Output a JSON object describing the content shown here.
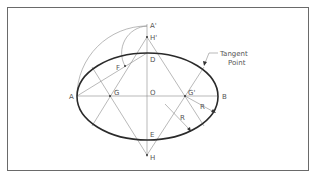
{
  "diagram": {
    "labels": {
      "A_prime": "A'",
      "H_prime": "H'",
      "D": "D",
      "F": "F",
      "A": "A",
      "G": "G",
      "O": "O",
      "G_prime": "G'",
      "B": "B",
      "R1": "R",
      "R2": "R",
      "E": "E",
      "H": "H",
      "tangent_line1": "Tangent",
      "tangent_line2": "Point"
    },
    "colors": {
      "frame": "#6a6a6a",
      "construction": "#8a8a8a",
      "ellipse": "#2a2a2a",
      "text": "#555555"
    }
  }
}
